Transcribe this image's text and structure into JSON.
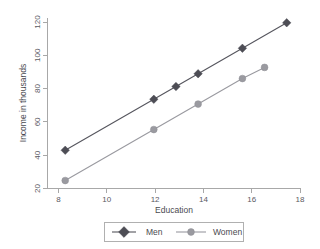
{
  "chart_data": {
    "type": "line",
    "title": "",
    "subtitle": "",
    "xlabel": "Education",
    "ylabel": "Income in thousands",
    "xlim": [
      7.2,
      18.6
    ],
    "ylim": [
      17,
      124
    ],
    "xticks": [
      8,
      10,
      12,
      14,
      16,
      18
    ],
    "yticks": [
      20,
      40,
      60,
      80,
      100,
      120
    ],
    "xtick_labels": [
      "8",
      "10",
      "12",
      "14",
      "16",
      "18"
    ],
    "ytick_labels": [
      "20",
      "40",
      "60",
      "80",
      "100",
      "120"
    ],
    "grid": false,
    "legend_position": "below-center",
    "series": [
      {
        "name": "Men",
        "color": "#4d4d55",
        "marker": "diamond",
        "x": [
          8,
          12,
          13,
          14,
          16,
          18
        ],
        "values": [
          41,
          73,
          81,
          89,
          105,
          121
        ]
      },
      {
        "name": "Women",
        "color": "#9a9aa0",
        "marker": "circle",
        "x": [
          8,
          12,
          14,
          16,
          17
        ],
        "values": [
          22,
          54,
          70,
          86,
          93
        ]
      }
    ]
  },
  "legend": {
    "men_label": "Men",
    "women_label": "Women"
  },
  "axes": {
    "x_title": "Education",
    "y_title": "Income in thousands"
  }
}
